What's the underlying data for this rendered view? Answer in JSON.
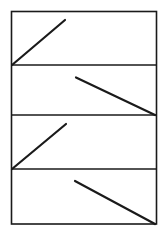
{
  "diagram": {
    "width": 168,
    "height": 237,
    "stroke_color": "#1a1a1a",
    "frame_stroke_width": 1.6,
    "line_stroke_width": 2.2,
    "frame": {
      "x": 11.5,
      "y": 11.5,
      "width": 145,
      "height": 212.5
    },
    "panels": [
      {
        "name": "panel-1",
        "top": 11.5,
        "bottom": 65,
        "segment": {
          "x1": 12,
          "y1": 65,
          "x2": 65,
          "y2": 20,
          "direction": "rising"
        }
      },
      {
        "name": "panel-2",
        "top": 65,
        "bottom": 115,
        "segment": {
          "x1": 76,
          "y1": 77.5,
          "x2": 155,
          "y2": 115,
          "direction": "falling"
        }
      },
      {
        "name": "panel-3",
        "top": 115,
        "bottom": 169,
        "segment": {
          "x1": 12,
          "y1": 169,
          "x2": 66,
          "y2": 124,
          "direction": "rising"
        }
      },
      {
        "name": "panel-4",
        "top": 169,
        "bottom": 224,
        "segment": {
          "x1": 75,
          "y1": 181,
          "x2": 155,
          "y2": 224,
          "direction": "falling"
        }
      }
    ],
    "dividers_y": [
      65,
      115,
      169
    ]
  }
}
